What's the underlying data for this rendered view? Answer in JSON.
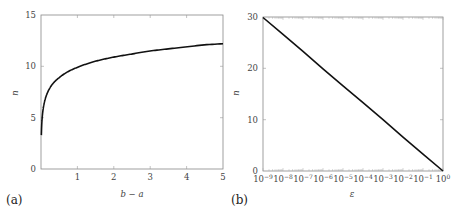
{
  "chart_data": [
    {
      "panel": "(a)",
      "type": "line",
      "title": "",
      "xlabel": "b − a",
      "ylabel": "n",
      "xlim": [
        0,
        5
      ],
      "ylim": [
        0,
        15
      ],
      "xticks": [
        "1",
        "2",
        "3",
        "4",
        "5"
      ],
      "yticks": [
        "0",
        "5",
        "10",
        "15"
      ],
      "grid": false,
      "legend": null,
      "series": [
        {
          "name": "n vs b−a",
          "x": [
            0.01,
            0.02,
            0.05,
            0.1,
            0.2,
            0.3,
            0.5,
            0.75,
            1,
            1.5,
            2,
            2.5,
            3,
            3.5,
            4,
            4.5,
            5
          ],
          "y": [
            3.3,
            4.3,
            5.6,
            6.6,
            7.6,
            8.2,
            8.9,
            9.5,
            9.9,
            10.5,
            10.9,
            11.2,
            11.5,
            11.7,
            11.9,
            12.1,
            12.2
          ]
        }
      ]
    },
    {
      "panel": "(b)",
      "type": "line",
      "title": "",
      "xlabel": "ε",
      "ylabel": "n",
      "xscale": "log",
      "xlim": [
        1e-09,
        1
      ],
      "ylim": [
        0,
        30
      ],
      "xticks": [
        "10^-9",
        "10^-8",
        "10^-7",
        "10^-6",
        "10^-5",
        "10^-4",
        "10^-3",
        "10^-2",
        "10^-1",
        "10^0"
      ],
      "yticks": [
        "0",
        "10",
        "20",
        "30"
      ],
      "grid": false,
      "legend": null,
      "series": [
        {
          "name": "n vs ε",
          "x": [
            1e-09,
            1e-08,
            1e-07,
            1e-06,
            1e-05,
            0.0001,
            0.001,
            0.01,
            0.1,
            1
          ],
          "y": [
            29.9,
            26.6,
            23.3,
            19.9,
            16.6,
            13.3,
            10.0,
            6.6,
            3.3,
            0
          ]
        }
      ]
    }
  ],
  "panels": {
    "a": {
      "label": "(a)",
      "xlabel": "b − a",
      "ylabel": "n",
      "xticks": [
        "1",
        "2",
        "3",
        "4",
        "5"
      ],
      "yticks": [
        "0",
        "5",
        "10",
        "15"
      ]
    },
    "b": {
      "label": "(b)",
      "xlabel": "ε",
      "ylabel": "n",
      "xtick_base": "10",
      "xtick_exps": [
        "−9",
        "−8",
        "−7",
        "−6",
        "−5",
        "−4",
        "−3",
        "−2",
        "−1",
        "0"
      ],
      "yticks": [
        "0",
        "10",
        "20",
        "30"
      ]
    }
  }
}
